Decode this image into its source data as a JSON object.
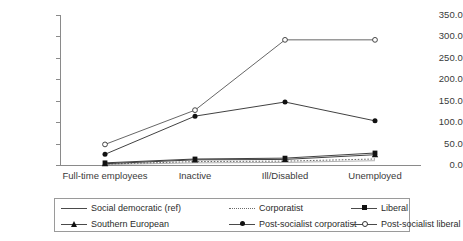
{
  "chart_data": {
    "type": "line",
    "title": "",
    "xlabel": "",
    "ylabel": "",
    "ylim": [
      0,
      350
    ],
    "grid": false,
    "legend_position": "bottom",
    "categories": [
      "Full-time employees",
      "Inactive",
      "Ill/Disabled",
      "Unemployed"
    ],
    "y_ticks": [
      "0.0",
      "50.0",
      "100.0",
      "150.0",
      "200.0",
      "250.0",
      "300.0",
      "350.0"
    ],
    "series": [
      {
        "name": "Social democratic (ref)",
        "marker": "none",
        "line": "solid",
        "color": "#a8a8a8",
        "values": [
          1,
          5,
          6,
          10
        ]
      },
      {
        "name": "Corporatist",
        "marker": "none",
        "line": "dotted",
        "color": "#6a6a6a",
        "values": [
          2,
          8,
          9,
          14
        ]
      },
      {
        "name": "Liberal",
        "marker": "square",
        "line": "solid",
        "color": "#2b2b2b",
        "values": [
          5,
          14,
          16,
          28
        ]
      },
      {
        "name": "Southern European",
        "marker": "triangle",
        "line": "solid",
        "color": "#2b2b2b",
        "values": [
          3,
          12,
          13,
          24
        ]
      },
      {
        "name": "Post-socialist corporatist",
        "marker": "circle",
        "line": "solid",
        "color": "#2b2b2b",
        "values": [
          25,
          114,
          147,
          103
        ]
      },
      {
        "name": "Post-socialist liberal",
        "marker": "open-circle",
        "line": "solid",
        "color": "#555555",
        "values": [
          48,
          128,
          292,
          292
        ]
      }
    ]
  },
  "legend": {
    "items": [
      {
        "label": "Social democratic (ref)",
        "icon": "solid-line-icon"
      },
      {
        "label": "Corporatist",
        "icon": "dotted-line-icon"
      },
      {
        "label": "Liberal",
        "icon": "filled-square-marker-icon"
      },
      {
        "label": "Southern European",
        "icon": "filled-triangle-marker-icon"
      },
      {
        "label": "Post-socialist corporatist",
        "icon": "filled-circle-marker-icon"
      },
      {
        "label": "Post-socialist liberal",
        "icon": "open-circle-marker-icon"
      }
    ]
  }
}
